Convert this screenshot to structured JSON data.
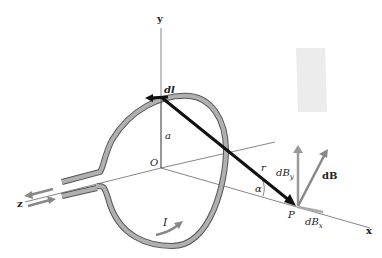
{
  "diagram": {
    "labels": {
      "y_axis": "y",
      "x_axis": "x",
      "z_axis": "z",
      "origin": "O",
      "dl": "dl",
      "radius": "a",
      "r": "r",
      "alpha": "α",
      "point": "P",
      "dBy": "dB",
      "dBy_sub": "y",
      "dB": "dB",
      "dBx": "dB",
      "dBx_sub": "x",
      "current": "I"
    },
    "colors": {
      "loop": "#a8a8a8",
      "loop_edge": "#555555",
      "vector": "#111111",
      "field_vector": "#8a8a8a",
      "field_box": "#e6e6e6",
      "axis": "#333333"
    }
  }
}
